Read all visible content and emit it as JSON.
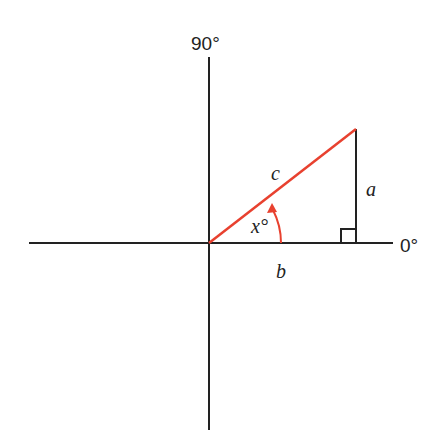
{
  "diagram": {
    "type": "right-triangle-on-axes",
    "axis_labels": {
      "top": "90°",
      "right": "0°"
    },
    "side_labels": {
      "hypotenuse": "c",
      "opposite": "a",
      "adjacent": "b"
    },
    "angle_label": "x°",
    "colors": {
      "axes": "#222222",
      "hypotenuse": "#e8412f",
      "angle_arc": "#e8412f",
      "vertical_side": "#222222"
    }
  }
}
